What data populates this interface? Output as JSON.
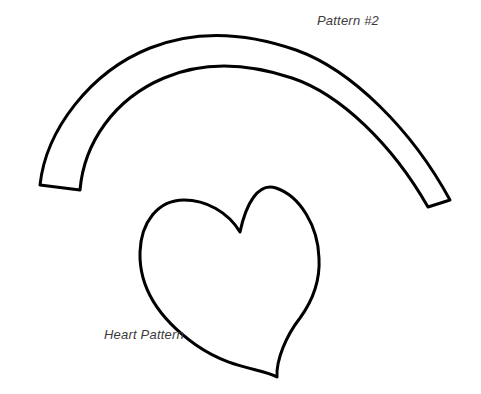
{
  "sheet": {
    "title": "Pattern Template Sheet",
    "width": 481,
    "height": 394,
    "background_color": "#ffffff",
    "ink_color": "#000000",
    "label_color": "#3b3b3b",
    "stroke_width": 3
  },
  "labels": {
    "arc_band": "Pattern #2",
    "heart": "Heart Pattern"
  },
  "shapes": {
    "arc_band": {
      "name": "curved-band-pattern",
      "description": "open crescent band with flat cut ends",
      "outer_arc_start": [
        40,
        185
      ],
      "outer_arc_apex": [
        255,
        38
      ],
      "outer_arc_end": [
        450,
        200
      ],
      "inner_arc_start": [
        80,
        190
      ],
      "inner_arc_apex": [
        258,
        70
      ],
      "inner_arc_end": [
        428,
        207
      ],
      "band_width_px": 32,
      "path": "M 40 185 C 46 130, 90 72, 150 48 C 200 28, 250 34, 296 50 C 352 70, 412 130, 450 200 L 428 207 C 392 144, 340 94, 292 78 C 250 64, 206 60, 164 78 C 114 99, 84 143, 80 190 Z"
    },
    "heart": {
      "name": "heart-pattern",
      "description": "hand-drawn asymmetric heart, taller right lobe, point at bottom",
      "left_extreme": [
        140,
        265
      ],
      "right_extreme": [
        319,
        262
      ],
      "cleft": [
        240,
        232
      ],
      "right_lobe_peak": [
        265,
        190
      ],
      "left_lobe_peak": [
        182,
        215
      ],
      "bottom_point": [
        277,
        377
      ],
      "path": "M 240 232 C 228 212, 206 200, 184 200 C 158 200, 141 222, 140 252 C 139 286, 158 318, 196 345 C 232 370, 262 368, 277 377 C 276 360, 286 336, 300 318 C 316 296, 320 276, 319 258 C 318 226, 300 196, 276 188 C 258 182, 246 204, 240 232 Z"
    }
  }
}
